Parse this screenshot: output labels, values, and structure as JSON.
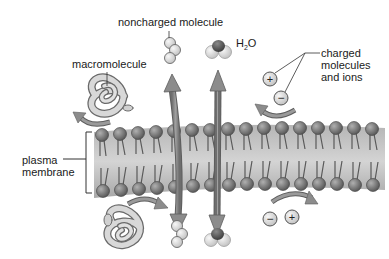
{
  "diagram": {
    "type": "selective-permeability",
    "labels": {
      "noncharged": "noncharged molecule",
      "h2o_main": "H",
      "h2o_sub": "2",
      "h2o_end": "O",
      "macromolecule": "macromolecule",
      "charged_line1": "charged",
      "charged_line2": "molecules",
      "charged_line3": "and ions",
      "plasma_line1": "plasma",
      "plasma_line2": "membrane"
    },
    "ion_symbols": {
      "plus": "+",
      "minus": "−"
    },
    "colors": {
      "membrane_band": "#9c9c9c",
      "membrane_band_light": "#c8c8c8",
      "head": "#6f6f6f",
      "head_highlight": "#a8a8a8",
      "arrow": "#8a8a8a",
      "arrow_stroke": "#5a5a5a",
      "molecule_fill": "#e2e2e2",
      "molecule_stroke": "#6a6a6a",
      "text": "#1a1a1a"
    },
    "components": [
      {
        "name": "noncharged-molecule",
        "passes": true
      },
      {
        "name": "water-molecule",
        "passes": true
      },
      {
        "name": "macromolecule",
        "passes": false
      },
      {
        "name": "charged-ions",
        "passes": false
      }
    ]
  }
}
